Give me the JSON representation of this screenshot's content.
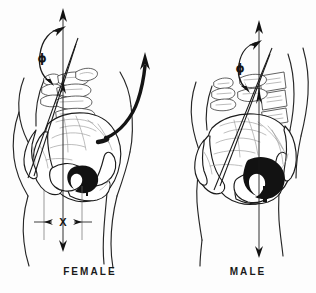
{
  "figure": {
    "type": "anatomical-line-drawing",
    "background_color": "#fdfdfd",
    "ink_color": "#1a1a1a",
    "width": 316,
    "height": 293
  },
  "panels": [
    {
      "id": "female",
      "caption": "FEMALE",
      "angle_symbol": "ϕ",
      "dimension_label": "X",
      "has_dimension_marker": true,
      "has_sweep_arrow": true,
      "center_x": 90
    },
    {
      "id": "male",
      "caption": "MALE",
      "angle_symbol": "ϕ",
      "dimension_label": "",
      "has_dimension_marker": false,
      "has_sweep_arrow": false,
      "center_x": 248
    }
  ],
  "annotations": {
    "phi_symbol": "ϕ",
    "dimension_x": "X",
    "axis_name": "vertical reference axis",
    "oblique_name": "pelvic inclination line"
  },
  "colors": {
    "ink": "#1a1a1a",
    "bone_detail": "#9a9a9a",
    "fill_black": "#121212",
    "background": "#fdfdfd",
    "paper_white": "#ffffff"
  }
}
